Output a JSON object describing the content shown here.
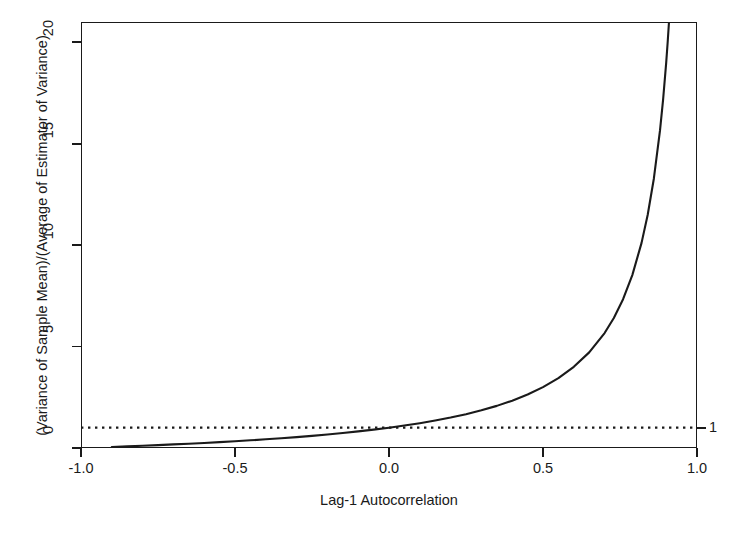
{
  "figure": {
    "background": "#ffffff",
    "foreground": "#1a1a1a",
    "top_crop_artifact": "             "
  },
  "chart_data": {
    "type": "line",
    "title": "",
    "subtitle": "",
    "xlabel": "Lag-1 Autocorrelation",
    "ylabel": "(Variance of Sample Mean)/(Average of Estimator of Variance)",
    "xlim": [
      -1.0,
      1.0
    ],
    "ylim": [
      0,
      21.0
    ],
    "xticks": [
      -1.0,
      -0.5,
      0.0,
      0.5,
      1.0
    ],
    "xticklabels": [
      "-1.0",
      "-0.5",
      "0.0",
      "0.5",
      "1.0"
    ],
    "yticks": [
      0,
      5,
      10,
      15,
      20
    ],
    "yticklabels": [
      "0",
      "5",
      "10",
      "15",
      "20"
    ],
    "right_axis_ticks": [
      1
    ],
    "right_axis_ticklabels": [
      "1"
    ],
    "grid": false,
    "legend": null,
    "series": [
      {
        "name": "(1+rho)/(1-rho)",
        "style": "solid",
        "color": "#1a1a1a",
        "width": 2.0,
        "x": [
          -0.9,
          -0.85,
          -0.8,
          -0.75,
          -0.7,
          -0.65,
          -0.6,
          -0.55,
          -0.5,
          -0.45,
          -0.4,
          -0.35,
          -0.3,
          -0.25,
          -0.2,
          -0.15,
          -0.1,
          -0.05,
          0.0,
          0.05,
          0.1,
          0.15,
          0.2,
          0.25,
          0.3,
          0.35,
          0.4,
          0.45,
          0.5,
          0.55,
          0.6,
          0.65,
          0.7,
          0.73,
          0.76,
          0.79,
          0.82,
          0.84,
          0.86,
          0.88,
          0.89,
          0.9,
          0.905,
          0.91
        ],
        "y": [
          0.0526,
          0.0811,
          0.1111,
          0.1429,
          0.1765,
          0.2121,
          0.25,
          0.2903,
          0.3333,
          0.3793,
          0.4286,
          0.4815,
          0.5385,
          0.6,
          0.6667,
          0.7391,
          0.8182,
          0.9048,
          1.0,
          1.1053,
          1.2222,
          1.3529,
          1.5,
          1.6667,
          1.8571,
          2.0769,
          2.3333,
          2.6364,
          3.0,
          3.4444,
          4.0,
          4.7143,
          5.6667,
          6.4074,
          7.3333,
          8.5238,
          10.1111,
          11.5,
          13.2857,
          15.6667,
          17.1818,
          19.0,
          20.0526,
          21.2222
        ]
      },
      {
        "name": "reference line at 1",
        "style": "dotted",
        "color": "#1a1a1a",
        "width": 2.0,
        "constant_y": 1.0
      }
    ],
    "annotations": [
      {
        "text": "1",
        "position": "right-axis",
        "value": 1.0
      }
    ]
  }
}
